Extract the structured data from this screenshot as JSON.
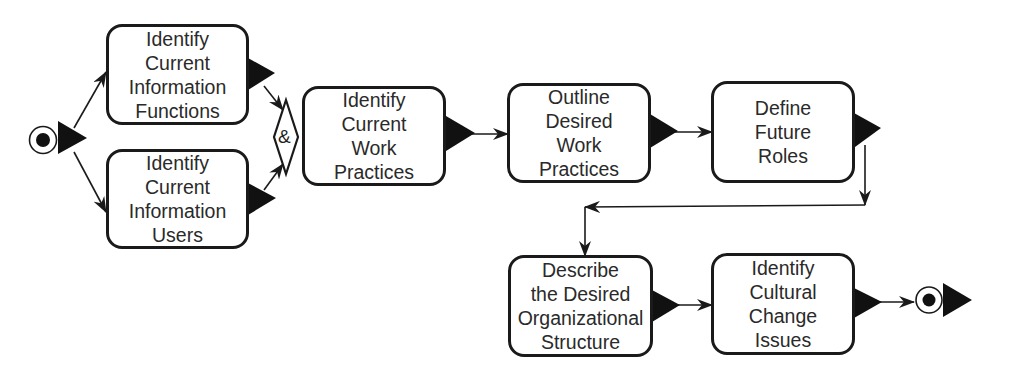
{
  "diagram": {
    "type": "activity-flow",
    "start_node": {
      "symbol": "start-circle"
    },
    "end_node": {
      "symbol": "end-circle"
    },
    "join": {
      "label": "&"
    },
    "activities": [
      {
        "id": "a1",
        "label": "Identify\nCurrent\nInformation\nFunctions"
      },
      {
        "id": "a2",
        "label": "Identify\nCurrent\nInformation\nUsers"
      },
      {
        "id": "a3",
        "label": "Identify\nCurrent\nWork\nPractices"
      },
      {
        "id": "a4",
        "label": "Outline\nDesired\nWork\nPractices"
      },
      {
        "id": "a5",
        "label": "Define\nFuture\nRoles"
      },
      {
        "id": "a6",
        "label": "Describe\nthe Desired\nOrganizational\nStructure"
      },
      {
        "id": "a7",
        "label": "Identify\nCultural\nChange\nIssues"
      }
    ],
    "edges": [
      [
        "start",
        "a1"
      ],
      [
        "start",
        "a2"
      ],
      [
        "a1",
        "join"
      ],
      [
        "a2",
        "join"
      ],
      [
        "join",
        "a3"
      ],
      [
        "a3",
        "a4"
      ],
      [
        "a4",
        "a5"
      ],
      [
        "a5",
        "a6"
      ],
      [
        "a6",
        "a7"
      ],
      [
        "a7",
        "end"
      ]
    ],
    "colors": {
      "stroke": "#1a1a1a",
      "text": "#2a2a2a",
      "background": "#ffffff"
    }
  }
}
